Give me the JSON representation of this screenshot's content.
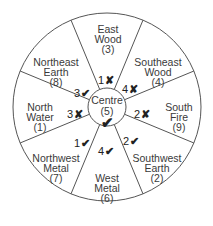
{
  "diagram": {
    "center": {
      "x": 107,
      "y": 107
    },
    "outer_radius": 94,
    "inner_radius": 19,
    "line_color": "#555555",
    "text_color": "#3a3a3a",
    "centre": {
      "name": "Centre",
      "number": "(5)",
      "mark": "✔"
    },
    "sectors": [
      {
        "id": "east-wood",
        "line1": "East",
        "line2": "Wood",
        "number": "(3)",
        "mark_num": "1",
        "mark": "✘"
      },
      {
        "id": "southeast-wood",
        "line1": "Southeast",
        "line2": "Wood",
        "number": "(4)",
        "mark_num": "4",
        "mark": "✘"
      },
      {
        "id": "south-fire",
        "line1": "South",
        "line2": "Fire",
        "number": "(9)",
        "mark_num": "2",
        "mark": "✘"
      },
      {
        "id": "southwest-earth",
        "line1": "Southwest",
        "line2": "Earth",
        "number": "(2)",
        "mark_num": "2",
        "mark": "✔"
      },
      {
        "id": "west-metal",
        "line1": "West",
        "line2": "Metal",
        "number": "(6)",
        "mark_num": "4",
        "mark": "✔"
      },
      {
        "id": "northwest-metal",
        "line1": "Northwest",
        "line2": "Metal",
        "number": "(7)",
        "mark_num": "1",
        "mark": "✔"
      },
      {
        "id": "north-water",
        "line1": "North",
        "line2": "Water",
        "number": "(1)",
        "mark_num": "3",
        "mark": "✘"
      },
      {
        "id": "northeast-earth",
        "line1": "Northeast",
        "line2": "Earth",
        "number": "(8)",
        "mark_num": "3",
        "mark": "✔"
      }
    ]
  }
}
